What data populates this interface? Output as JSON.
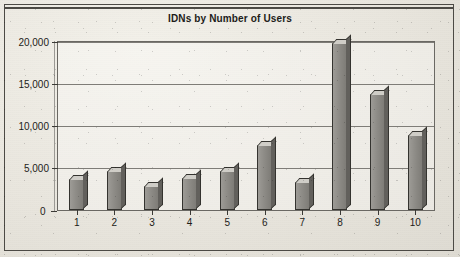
{
  "figure": {
    "title": "IDNs by Number of Users",
    "background_color": "#ece9e1",
    "border_color": "#4c4a45",
    "bar_fill_color": "#8e8c87",
    "bar_outline_color": "#34332f",
    "bar_top_color": "#cfcdc7",
    "bar_side_color": "#62605c",
    "gridline_color": "#7e7c77"
  },
  "chart_data": {
    "type": "bar",
    "title": "IDNs by Number of Users",
    "xlabel": "",
    "ylabel": "",
    "categories": [
      "1",
      "2",
      "3",
      "4",
      "5",
      "6",
      "7",
      "8",
      "9",
      "10"
    ],
    "values": [
      3700,
      4700,
      2800,
      3800,
      4700,
      7700,
      3300,
      19900,
      13800,
      8900
    ],
    "ylim": [
      0,
      20000
    ],
    "yticks": [
      0,
      5000,
      10000,
      15000,
      20000
    ],
    "ytick_labels": [
      "0",
      "5,000",
      "10,000",
      "15,000",
      "20,000"
    ],
    "grid": true,
    "grid_axis": "y",
    "legend": null,
    "legend_position": "none",
    "style": "3d-bar"
  }
}
